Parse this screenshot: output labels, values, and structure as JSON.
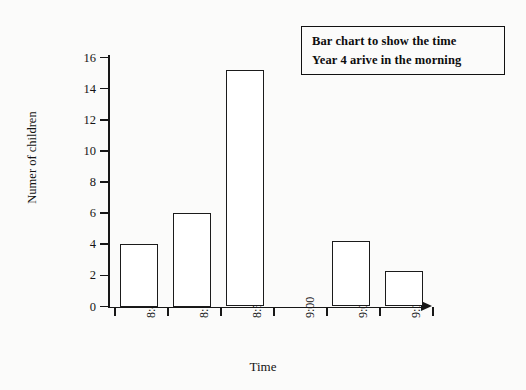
{
  "title_box": {
    "line1": "Bar chart to show the time",
    "line2": "Year 4 arive in the morning"
  },
  "chart_data": {
    "type": "bar",
    "title": "Bar chart to show the time Year 4 arive in the morning",
    "categories": [
      "8:45",
      "8:50",
      "8:55",
      "9:00",
      "9:05",
      "9:10"
    ],
    "values": [
      4,
      6,
      15.2,
      0,
      4.2,
      2.3
    ],
    "xlabel": "Time",
    "ylabel": "Numer of children",
    "ylim": [
      0,
      16
    ],
    "ytick_step": 2,
    "yticks": [
      0,
      2,
      4,
      6,
      8,
      10,
      12,
      14,
      16
    ],
    "ytick_labels": [
      "0",
      "2",
      "4",
      "6",
      "8",
      "10",
      "12",
      "14",
      "16"
    ],
    "grid": false,
    "legend": null,
    "bar_fill": "#ffffff",
    "bar_edge": "#1b1b1b",
    "background": "#fbfbfa",
    "x_axis_arrow": true
  }
}
